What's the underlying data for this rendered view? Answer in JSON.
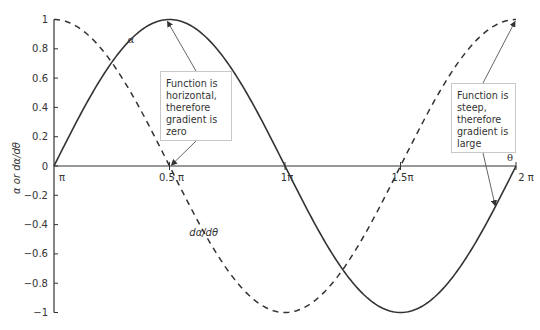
{
  "chart_data": {
    "type": "line",
    "title": "",
    "xlabel": "θ",
    "ylabel": "α or dα/dθ",
    "xlim": [
      0,
      6.2832
    ],
    "ylim": [
      -1,
      1
    ],
    "grid": false,
    "x_ticks": [
      {
        "value": 0,
        "label": "π"
      },
      {
        "value": 1.5708,
        "label": "0.5 π"
      },
      {
        "value": 3.1416,
        "label": "1π"
      },
      {
        "value": 4.7124,
        "label": "1.5π"
      },
      {
        "value": 6.2832,
        "label": "2 π"
      }
    ],
    "y_ticks": [
      {
        "value": 1,
        "label": "1"
      },
      {
        "value": 0.8,
        "label": "0.8"
      },
      {
        "value": 0.6,
        "label": "0.6"
      },
      {
        "value": 0.4,
        "label": "0.4"
      },
      {
        "value": 0.2,
        "label": "0.2"
      },
      {
        "value": 0,
        "label": "0"
      },
      {
        "value": -0.2,
        "label": "-0.2"
      },
      {
        "value": -0.4,
        "label": "-0.4"
      },
      {
        "value": -0.6,
        "label": "-0.6"
      },
      {
        "value": -0.8,
        "label": "-0.8"
      },
      {
        "value": -1,
        "label": "−1"
      }
    ],
    "series": [
      {
        "name": "α",
        "style": "solid",
        "function": "sin(θ)",
        "x": [
          0,
          0.7854,
          1.5708,
          2.3562,
          3.1416,
          3.927,
          4.7124,
          5.4978,
          6.2832
        ],
        "values": [
          0,
          0.707,
          1,
          0.707,
          0,
          -0.707,
          -1,
          -0.707,
          0
        ]
      },
      {
        "name": "dα/dθ",
        "style": "dashed",
        "function": "cos(θ)",
        "x": [
          0,
          0.7854,
          1.5708,
          2.3562,
          3.1416,
          3.927,
          4.7124,
          5.4978,
          6.2832
        ],
        "values": [
          1,
          0.707,
          0,
          -0.707,
          -1,
          -0.707,
          0,
          0.707,
          1
        ]
      }
    ],
    "annotations": [
      {
        "text": "Function is\nhorizontal,\ntherefore\ngradient is\nzero",
        "arrows_to": [
          [
            1.5708,
            1
          ],
          [
            1.5708,
            0
          ]
        ]
      },
      {
        "text": "Function is\nsteep,\ntherefore\ngradient is\nlarge",
        "arrows_to": [
          [
            6.2832,
            1
          ],
          [
            6.0,
            -0.27
          ]
        ]
      }
    ],
    "series_labels": [
      {
        "text": "α",
        "x": 1.0,
        "y": 0.84
      },
      {
        "text": "dα/dθ",
        "x": 1.84,
        "y": -0.48
      }
    ],
    "colors": {
      "axis": "#333333",
      "line": "#333333",
      "box_border": "#c8c8c8",
      "arrow": "#555555"
    }
  }
}
